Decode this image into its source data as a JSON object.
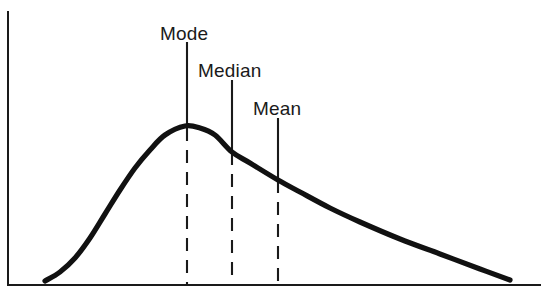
{
  "chart_data": {
    "type": "line",
    "title": "",
    "subtitle": "",
    "xlabel": "",
    "ylabel": "",
    "grid": false,
    "legend": "none",
    "xlim": [
      0,
      543
    ],
    "ylim": [
      0,
      302
    ],
    "axes": {
      "y_axis": {
        "x": 8,
        "y_top": 12,
        "y_bottom": 285
      },
      "x_axis": {
        "y": 285,
        "x_left": 8,
        "x_right": 540
      }
    },
    "curve": {
      "name": "skewed distribution",
      "color": "#111111",
      "x": [
        45,
        60,
        75,
        90,
        105,
        120,
        135,
        150,
        165,
        185,
        200,
        215,
        232,
        250,
        278,
        300,
        330,
        360,
        400,
        440,
        480,
        510
      ],
      "y": [
        281,
        272,
        258,
        238,
        214,
        190,
        168,
        150,
        135,
        126,
        128,
        135,
        152,
        163,
        180,
        192,
        208,
        222,
        239,
        254,
        269,
        280
      ]
    },
    "markers": [
      {
        "id": "mode",
        "label": "Mode",
        "x": 187,
        "label_x": 160,
        "label_y": 40,
        "solid_top": 42,
        "curve_y": 128,
        "baseline_y": 285,
        "order": 1
      },
      {
        "id": "median",
        "label": "Median",
        "x": 232,
        "label_x": 198,
        "label_y": 77,
        "solid_top": 80,
        "curve_y": 152,
        "baseline_y": 285,
        "order": 2
      },
      {
        "id": "mean",
        "label": "Mean",
        "x": 278,
        "label_x": 253,
        "label_y": 115,
        "solid_top": 118,
        "curve_y": 180,
        "baseline_y": 285,
        "order": 3
      }
    ],
    "colors": {
      "background": "#ffffff",
      "curve": "#111111",
      "axis": "#1a1a1a",
      "marker": "#1a1a1a",
      "text": "#1a1a1a"
    }
  }
}
